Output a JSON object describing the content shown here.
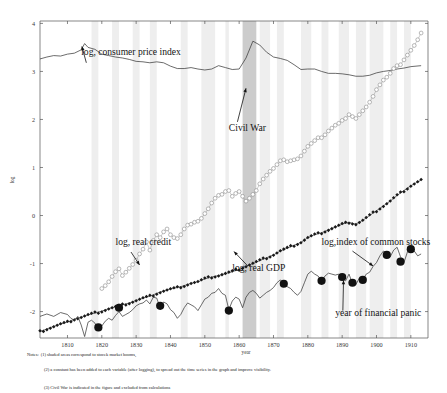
{
  "chart_data": {
    "type": "line",
    "title": "",
    "xlabel": "year",
    "ylabel": "log",
    "xlim": [
      1802,
      1915
    ],
    "ylim": [
      -2.55,
      4.05
    ],
    "grid": false,
    "legend_position": "inline-annotations",
    "xticks": [
      1810,
      1820,
      1830,
      1840,
      1850,
      1860,
      1870,
      1880,
      1890,
      1900,
      1910
    ],
    "yticks": [
      -2,
      -1,
      0,
      1,
      2,
      3,
      4
    ],
    "annotations": [
      {
        "id": "cpi",
        "text": "log, consumer price index",
        "x": 1814,
        "y": 3.35
      },
      {
        "id": "civil-war",
        "text": "Civil War",
        "x": 1857,
        "y": 1.75
      },
      {
        "id": "real-credit",
        "text": "log, real credit",
        "x": 1824,
        "y": -0.62
      },
      {
        "id": "real-gdp",
        "text": "log, real GDP",
        "x": 1858,
        "y": -1.15
      },
      {
        "id": "common-stocks",
        "text": "log,index of common stocks",
        "x": 1884,
        "y": -0.62
      },
      {
        "id": "financial-panic",
        "text": "year of financial panic",
        "x": 1888,
        "y": -2.1
      }
    ],
    "shaded_regions": {
      "stock_market_booms_color": "#eeeeee",
      "civil_war_color": "#cccccc",
      "civil_war_span": [
        1861,
        1865
      ],
      "boom_spans": [
        [
          1817,
          1819
        ],
        [
          1823,
          1825
        ],
        [
          1829,
          1831
        ],
        [
          1834,
          1836
        ],
        [
          1843,
          1845
        ],
        [
          1849,
          1853
        ],
        [
          1856,
          1857
        ],
        [
          1862,
          1864
        ],
        [
          1866,
          1869
        ],
        [
          1871,
          1873
        ],
        [
          1878,
          1881
        ],
        [
          1884,
          1886
        ],
        [
          1889,
          1892
        ],
        [
          1894,
          1897
        ],
        [
          1898,
          1902
        ],
        [
          1904,
          1906
        ],
        [
          1908,
          1910
        ]
      ]
    },
    "series": [
      {
        "name": "log, consumer price index",
        "marker": "none",
        "color": "#3b3b3b",
        "x": [
          1802,
          1804,
          1806,
          1808,
          1810,
          1812,
          1814,
          1815,
          1816,
          1818,
          1820,
          1822,
          1824,
          1826,
          1828,
          1830,
          1832,
          1834,
          1836,
          1838,
          1840,
          1842,
          1844,
          1846,
          1848,
          1850,
          1852,
          1854,
          1856,
          1858,
          1860,
          1862,
          1864,
          1866,
          1868,
          1870,
          1872,
          1874,
          1876,
          1878,
          1880,
          1882,
          1884,
          1886,
          1888,
          1890,
          1892,
          1894,
          1896,
          1898,
          1900,
          1902,
          1904,
          1906,
          1908,
          1910,
          1913
        ],
        "y": [
          3.26,
          3.3,
          3.33,
          3.32,
          3.36,
          3.38,
          3.45,
          3.58,
          3.5,
          3.46,
          3.36,
          3.33,
          3.3,
          3.28,
          3.25,
          3.21,
          3.2,
          3.18,
          3.2,
          3.18,
          3.11,
          3.06,
          3.06,
          3.08,
          3.05,
          3.03,
          3.05,
          3.12,
          3.08,
          3.04,
          3.05,
          3.28,
          3.63,
          3.55,
          3.4,
          3.3,
          3.27,
          3.23,
          3.14,
          3.04,
          3.05,
          3.05,
          3.0,
          2.96,
          2.96,
          2.95,
          2.93,
          2.9,
          2.9,
          2.92,
          2.97,
          3.0,
          3.02,
          3.05,
          3.07,
          3.1,
          3.12
        ]
      },
      {
        "name": "log, real credit",
        "marker": "open-circle",
        "color": "#8a8a8a",
        "x": [
          1820,
          1821,
          1822,
          1823,
          1824,
          1825,
          1826,
          1827,
          1828,
          1829,
          1830,
          1831,
          1832,
          1833,
          1834,
          1835,
          1836,
          1837,
          1838,
          1839,
          1840,
          1841,
          1842,
          1843,
          1844,
          1845,
          1846,
          1847,
          1848,
          1849,
          1850,
          1851,
          1852,
          1853,
          1854,
          1855,
          1856,
          1857,
          1858,
          1859,
          1860,
          1861,
          1862,
          1863,
          1864,
          1865,
          1866,
          1867,
          1868,
          1869,
          1870,
          1871,
          1872,
          1873,
          1874,
          1875,
          1876,
          1877,
          1878,
          1879,
          1880,
          1881,
          1882,
          1883,
          1884,
          1885,
          1886,
          1887,
          1888,
          1889,
          1890,
          1891,
          1892,
          1893,
          1894,
          1895,
          1896,
          1897,
          1898,
          1899,
          1900,
          1901,
          1902,
          1903,
          1904,
          1905,
          1906,
          1907,
          1908,
          1909,
          1910,
          1911,
          1912,
          1913
        ],
        "y": [
          -1.52,
          -1.46,
          -1.38,
          -1.27,
          -1.17,
          -1.11,
          -1.25,
          -1.18,
          -1.1,
          -1.02,
          -0.93,
          -0.8,
          -0.7,
          -0.55,
          -0.72,
          -0.52,
          -0.4,
          -0.46,
          -0.34,
          -0.28,
          -0.4,
          -0.46,
          -0.48,
          -0.4,
          -0.28,
          -0.2,
          -0.18,
          -0.14,
          -0.12,
          -0.06,
          0.04,
          0.14,
          0.26,
          0.36,
          0.42,
          0.44,
          0.5,
          0.52,
          0.4,
          0.46,
          0.5,
          0.4,
          0.3,
          0.36,
          0.44,
          0.52,
          0.66,
          0.76,
          0.84,
          0.92,
          0.98,
          1.06,
          1.14,
          1.16,
          1.12,
          1.14,
          1.16,
          1.18,
          1.24,
          1.34,
          1.44,
          1.5,
          1.56,
          1.62,
          1.62,
          1.68,
          1.76,
          1.82,
          1.88,
          1.92,
          1.98,
          2.02,
          2.1,
          2.06,
          2.02,
          2.1,
          2.18,
          2.26,
          2.36,
          2.48,
          2.62,
          2.72,
          2.82,
          2.88,
          2.96,
          3.06,
          3.12,
          3.14,
          3.24,
          3.34,
          3.44,
          3.54,
          3.66,
          3.8
        ]
      },
      {
        "name": "log, real GDP",
        "marker": "filled-diamond",
        "color": "#1a1a1a",
        "x": [
          1802,
          1804,
          1806,
          1808,
          1810,
          1812,
          1814,
          1816,
          1818,
          1820,
          1822,
          1824,
          1826,
          1828,
          1830,
          1832,
          1834,
          1836,
          1838,
          1840,
          1842,
          1844,
          1846,
          1848,
          1850,
          1852,
          1854,
          1856,
          1858,
          1860,
          1862,
          1864,
          1866,
          1868,
          1870,
          1872,
          1874,
          1876,
          1878,
          1880,
          1882,
          1884,
          1886,
          1888,
          1890,
          1892,
          1894,
          1896,
          1898,
          1900,
          1902,
          1904,
          1906,
          1908,
          1910,
          1913
        ],
        "y": [
          -2.42,
          -2.36,
          -2.31,
          -2.26,
          -2.22,
          -2.16,
          -2.12,
          -2.07,
          -2.03,
          -1.99,
          -1.94,
          -1.9,
          -1.86,
          -1.82,
          -1.77,
          -1.72,
          -1.68,
          -1.62,
          -1.57,
          -1.53,
          -1.5,
          -1.46,
          -1.41,
          -1.38,
          -1.32,
          -1.28,
          -1.25,
          -1.21,
          -1.17,
          -1.12,
          -1.06,
          -1.0,
          -0.94,
          -0.88,
          -0.82,
          -0.74,
          -0.68,
          -0.62,
          -0.56,
          -0.46,
          -0.4,
          -0.36,
          -0.3,
          -0.24,
          -0.18,
          -0.14,
          -0.18,
          -0.1,
          0.0,
          0.1,
          0.2,
          0.3,
          0.42,
          0.52,
          0.62,
          0.74
        ]
      },
      {
        "name": "log,index of common stocks",
        "marker": "none",
        "color": "#3b3b3b",
        "x": [
          1802,
          1804,
          1806,
          1808,
          1810,
          1811,
          1812,
          1813,
          1814,
          1815,
          1816,
          1817,
          1818,
          1819,
          1820,
          1821,
          1822,
          1823,
          1824,
          1825,
          1826,
          1827,
          1828,
          1829,
          1830,
          1831,
          1832,
          1833,
          1834,
          1835,
          1836,
          1837,
          1838,
          1839,
          1840,
          1841,
          1842,
          1843,
          1844,
          1845,
          1846,
          1847,
          1848,
          1849,
          1850,
          1851,
          1852,
          1853,
          1854,
          1855,
          1856,
          1857,
          1858,
          1859,
          1860,
          1861,
          1862,
          1863,
          1864,
          1865,
          1866,
          1867,
          1868,
          1869,
          1870,
          1871,
          1872,
          1873,
          1874,
          1875,
          1876,
          1877,
          1878,
          1879,
          1880,
          1881,
          1882,
          1883,
          1884,
          1885,
          1886,
          1887,
          1888,
          1889,
          1890,
          1891,
          1892,
          1893,
          1894,
          1895,
          1896,
          1897,
          1898,
          1899,
          1900,
          1901,
          1902,
          1903,
          1904,
          1905,
          1906,
          1907,
          1908,
          1909,
          1910,
          1911,
          1912,
          1913
        ],
        "y": [
          -2.1,
          -2.05,
          -2.1,
          -2.02,
          -2.06,
          -2.14,
          -2.18,
          -2.1,
          -2.28,
          -2.52,
          -2.22,
          -2.18,
          -2.24,
          -2.38,
          -2.3,
          -2.2,
          -2.14,
          -2.18,
          -2.08,
          -2.0,
          -2.1,
          -2.06,
          -2.02,
          -1.96,
          -1.88,
          -1.84,
          -1.82,
          -1.76,
          -1.84,
          -1.7,
          -1.72,
          -1.92,
          -1.8,
          -1.84,
          -1.96,
          -2.02,
          -2.14,
          -2.06,
          -1.92,
          -1.82,
          -1.86,
          -1.9,
          -1.98,
          -1.86,
          -1.74,
          -1.7,
          -1.62,
          -1.6,
          -1.52,
          -1.62,
          -1.66,
          -1.96,
          -1.78,
          -1.7,
          -1.74,
          -1.92,
          -1.7,
          -1.6,
          -1.56,
          -1.62,
          -1.72,
          -1.66,
          -1.6,
          -1.56,
          -1.5,
          -1.4,
          -1.34,
          -1.42,
          -1.48,
          -1.52,
          -1.6,
          -1.66,
          -1.58,
          -1.4,
          -1.22,
          -1.16,
          -1.22,
          -1.26,
          -1.36,
          -1.26,
          -1.2,
          -1.22,
          -1.24,
          -1.22,
          -1.3,
          -1.36,
          -1.22,
          -1.42,
          -1.44,
          -1.3,
          -1.34,
          -1.22,
          -1.18,
          -1.06,
          -0.98,
          -0.84,
          -0.74,
          -0.78,
          -0.86,
          -0.72,
          -0.66,
          -0.86,
          -0.98,
          -0.76,
          -0.68,
          -0.74,
          -0.84,
          -0.8
        ]
      }
    ],
    "panic_years": [
      {
        "year": 1819,
        "y": -2.33
      },
      {
        "year": 1825,
        "y": -1.92
      },
      {
        "year": 1837,
        "y": -1.88
      },
      {
        "year": 1857,
        "y": -1.98
      },
      {
        "year": 1873,
        "y": -1.42
      },
      {
        "year": 1884,
        "y": -1.36
      },
      {
        "year": 1890,
        "y": -1.28
      },
      {
        "year": 1893,
        "y": -1.4
      },
      {
        "year": 1896,
        "y": -1.34
      },
      {
        "year": 1903,
        "y": -0.82
      },
      {
        "year": 1907,
        "y": -0.96
      },
      {
        "year": 1910,
        "y": -0.7
      }
    ]
  },
  "notes": {
    "label": "Notes:",
    "line1": "(1) shaded areas correspond to stocek market booms,",
    "line2": "(2) a constant has been added to each variable (after logging), to spread out the time series in the graph and improve visibility.",
    "line3": "(3) Civil War is indicated in the figure and excluded from calculations"
  }
}
